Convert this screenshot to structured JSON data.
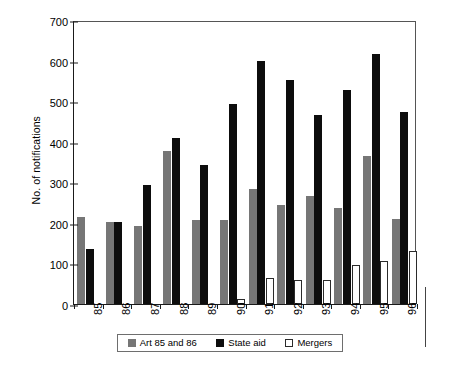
{
  "chart_data": {
    "type": "bar",
    "title": "",
    "subtitle": "",
    "xlabel": "",
    "ylabel": "No. of notifications",
    "categories": [
      "85",
      "86",
      "87",
      "88",
      "89",
      "90",
      "91",
      "92",
      "93",
      "94",
      "95",
      "96"
    ],
    "series": [
      {
        "name": "Art 85 and 86",
        "color": "#767676",
        "values": [
          215,
          202,
          193,
          377,
          208,
          207,
          284,
          245,
          267,
          237,
          366,
          210
        ]
      },
      {
        "name": "State aid",
        "color": "#0d0d0d",
        "values": [
          135,
          202,
          294,
          410,
          343,
          492,
          600,
          551,
          467,
          527,
          616,
          474
        ]
      },
      {
        "name": "Mergers",
        "color": "#ffffff",
        "values": [
          0,
          0,
          0,
          0,
          0,
          12,
          63,
          60,
          58,
          95,
          105,
          131
        ]
      }
    ],
    "ylim": [
      0,
      700
    ],
    "yticks": [
      0,
      100,
      200,
      300,
      400,
      500,
      600,
      700
    ],
    "ytick_labels": [
      "0",
      "100",
      "200",
      "300",
      "400",
      "500",
      "600",
      "700"
    ],
    "grid": false,
    "legend_position": "bottom",
    "legend_entries": [
      "Art 85 and 86",
      "State aid",
      "Mergers"
    ]
  },
  "axis": {
    "y_title": "No. of notifications"
  }
}
